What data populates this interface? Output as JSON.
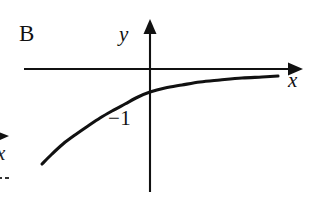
{
  "figure": {
    "panel_label": "B",
    "background_color": "#ffffff",
    "ink_color": "#111111"
  },
  "axes": {
    "x_axis": {
      "label": "x",
      "arrow": "right",
      "arrow_head_icon": "arrow-right-icon",
      "start_px": {
        "x": 24,
        "y": 69
      },
      "end_px": {
        "x": 301,
        "y": 69
      }
    },
    "y_axis": {
      "label": "y",
      "arrow": "up",
      "arrow_head_icon": "arrow-up-icon",
      "start_px": {
        "x": 150,
        "y": 192
      },
      "end_px": {
        "x": 150,
        "y": 20
      }
    },
    "origin_px": {
      "x": 150,
      "y": 69
    }
  },
  "tick_labels": [
    {
      "name": "y-intercept",
      "text": "−1",
      "value": -1
    }
  ],
  "fragment": {
    "note": "cropped neighboring figure at left edge",
    "axis_label": "x",
    "arrow_icon": "arrow-right-icon"
  },
  "chart_data": {
    "type": "line",
    "title": "B",
    "xlabel": "x",
    "ylabel": "y",
    "grid": false,
    "legend": null,
    "annotations": [
      {
        "text": "−1",
        "at": "y-intercept",
        "x": 0,
        "y": -1
      }
    ],
    "series": [
      {
        "name": "curve-b",
        "shape": "logarithmic",
        "description": "increasing, concave down, y-intercept at -1, approaches x-axis asymptotically to the right, falls steeply toward lower-left",
        "y_intercept": -1,
        "points_px": [
          {
            "x": 42,
            "y": 164
          },
          {
            "x": 52,
            "y": 154
          },
          {
            "x": 63,
            "y": 144
          },
          {
            "x": 75,
            "y": 135
          },
          {
            "x": 88,
            "y": 126
          },
          {
            "x": 100,
            "y": 118
          },
          {
            "x": 112,
            "y": 111
          },
          {
            "x": 125,
            "y": 104
          },
          {
            "x": 138,
            "y": 97
          },
          {
            "x": 150,
            "y": 92
          },
          {
            "x": 165,
            "y": 88
          },
          {
            "x": 182,
            "y": 85
          },
          {
            "x": 200,
            "y": 82
          },
          {
            "x": 220,
            "y": 80
          },
          {
            "x": 242,
            "y": 78
          },
          {
            "x": 262,
            "y": 77
          },
          {
            "x": 278,
            "y": 76
          }
        ]
      }
    ]
  }
}
